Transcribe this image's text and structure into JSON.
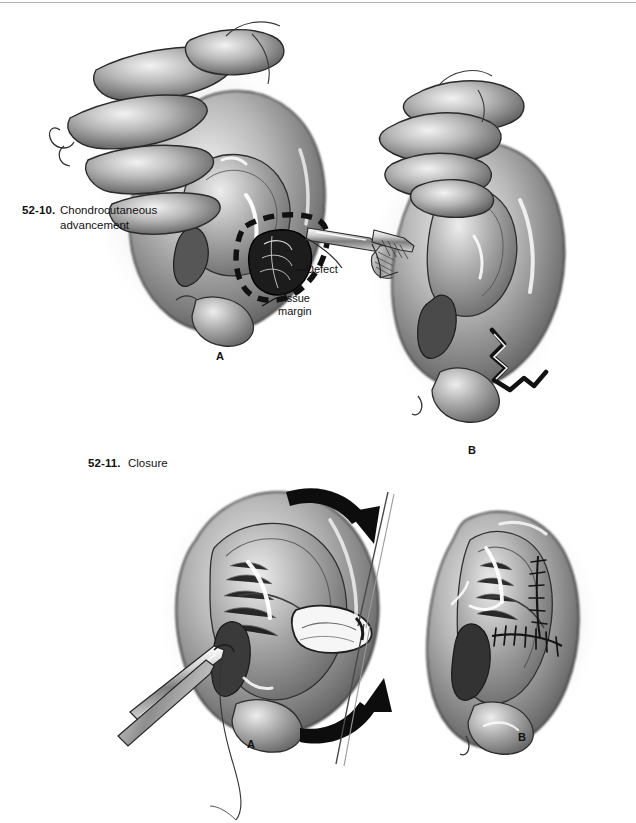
{
  "page": {
    "background": "#ffffff",
    "border_color": "#9a9a9a",
    "ink_color": "#111111",
    "illustration_style": "grayscale airbrush / pencil medical illustration"
  },
  "figures": [
    {
      "id": "52-10",
      "number": "52-10.",
      "title_line1": "Chondrocutaneous",
      "title_line2": "advancement",
      "panels": [
        {
          "letter": "A",
          "description": "Ear with dashed tissue margin outline around lesion; forceps grasping defect"
        },
        {
          "letter": "B",
          "description": "Ear after excision showing zigzag wound edge at antihelix/lobule"
        }
      ],
      "annotations": [
        {
          "id": "defect",
          "label": "Defect"
        },
        {
          "id": "tissue-margin",
          "label": "Tissue\nmargin",
          "line1": "Tissue",
          "line2": "margin"
        }
      ]
    },
    {
      "id": "52-11",
      "number": "52-11.",
      "title_line1": "Closure",
      "panels": [
        {
          "letter": "A",
          "description": "Ear with two curved black advancement arrows, forceps and suture needle"
        },
        {
          "letter": "B",
          "description": "Completed closure with running suture line visible"
        }
      ],
      "annotations": []
    }
  ],
  "captions": {
    "fig1_number": "52-10.",
    "fig1_line1": "Chondrocutaneous",
    "fig1_line2": "advancement",
    "fig2_number": "52-11.",
    "fig2_line1": "Closure"
  },
  "annotations": {
    "defect": "Defect",
    "tissue_line1": "Tissue",
    "tissue_line2": "margin"
  },
  "panel_letters": {
    "fig1_a": "A",
    "fig1_b": "B",
    "fig2_a": "A",
    "fig2_b": "B"
  },
  "colors": {
    "ink": "#111111",
    "mid_gray": "#808080",
    "light_gray": "#cfcfcf",
    "dark_shadow": "#3a3a3a",
    "paper": "#ffffff",
    "rule": "#9a9a9a"
  }
}
